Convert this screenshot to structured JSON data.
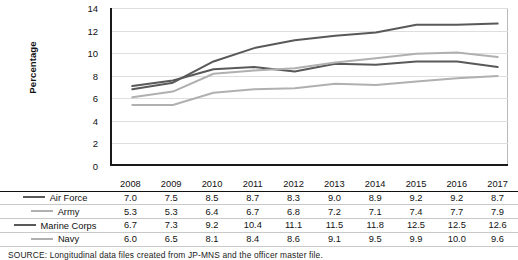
{
  "chart_data": {
    "type": "line",
    "title": "",
    "xlabel": "",
    "ylabel": "Percentage",
    "ylim": [
      0,
      14
    ],
    "ytick_step": 2,
    "yticks": [
      "14",
      "12",
      "10",
      "8",
      "6",
      "4",
      "2",
      "0"
    ],
    "grid": true,
    "legend_position": "table-row-labels",
    "categories": [
      "2008",
      "2009",
      "2010",
      "2011",
      "2012",
      "2013",
      "2014",
      "2015",
      "2016",
      "2017"
    ],
    "series": [
      {
        "name": "Air Force",
        "color": "#595959",
        "values": [
          7.0,
          7.5,
          8.5,
          8.7,
          8.3,
          9.0,
          8.9,
          9.2,
          9.2,
          8.7
        ],
        "labels": [
          "7.0",
          "7.5",
          "8.5",
          "8.7",
          "8.3",
          "9.0",
          "8.9",
          "9.2",
          "9.2",
          "8.7"
        ]
      },
      {
        "name": "Army",
        "color": "#b0b0b0",
        "values": [
          5.3,
          5.3,
          6.4,
          6.7,
          6.8,
          7.2,
          7.1,
          7.4,
          7.7,
          7.9
        ],
        "labels": [
          "5.3",
          "5.3",
          "6.4",
          "6.7",
          "6.8",
          "7.2",
          "7.1",
          "7.4",
          "7.7",
          "7.9"
        ]
      },
      {
        "name": "Marine Corps",
        "color": "#595959",
        "values": [
          6.7,
          7.3,
          9.2,
          10.4,
          11.1,
          11.5,
          11.8,
          12.5,
          12.5,
          12.6
        ],
        "labels": [
          "6.7",
          "7.3",
          "9.2",
          "10.4",
          "11.1",
          "11.5",
          "11.8",
          "12.5",
          "12.5",
          "12.6"
        ]
      },
      {
        "name": "Navy",
        "color": "#b0b0b0",
        "values": [
          6.0,
          6.5,
          8.1,
          8.4,
          8.6,
          9.1,
          9.5,
          9.9,
          10.0,
          9.6
        ],
        "labels": [
          "6.0",
          "6.5",
          "8.1",
          "8.4",
          "8.6",
          "9.1",
          "9.5",
          "9.9",
          "10.0",
          "9.6"
        ]
      }
    ]
  },
  "table": {
    "series_header": "",
    "column_headers": [
      "2008",
      "2009",
      "2010",
      "2011",
      "2012",
      "2013",
      "2014",
      "2015",
      "2016",
      "2017"
    ],
    "rows": [
      {
        "label": "Air Force",
        "values": [
          "7.0",
          "7.5",
          "8.5",
          "8.7",
          "8.3",
          "9.0",
          "8.9",
          "9.2",
          "9.2",
          "8.7"
        ]
      },
      {
        "label": "Army",
        "values": [
          "5.3",
          "5.3",
          "6.4",
          "6.7",
          "6.8",
          "7.2",
          "7.1",
          "7.4",
          "7.7",
          "7.9"
        ]
      },
      {
        "label": "Marine Corps",
        "values": [
          "6.7",
          "7.3",
          "9.2",
          "10.4",
          "11.1",
          "11.5",
          "11.8",
          "12.5",
          "12.5",
          "12.6"
        ]
      },
      {
        "label": "Navy",
        "values": [
          "6.0",
          "6.5",
          "8.1",
          "8.4",
          "8.6",
          "9.1",
          "9.5",
          "9.9",
          "10.0",
          "9.6"
        ]
      }
    ]
  },
  "source": {
    "text": "SOURCE: Longitudinal data files created from JP-MNS and the officer master file."
  },
  "colors": {
    "dark_series": "#595959",
    "light_series": "#b0b0b0",
    "axis": "#1a1a1a",
    "gridline": "#dedede",
    "table_rule": "#c9c9c9"
  }
}
